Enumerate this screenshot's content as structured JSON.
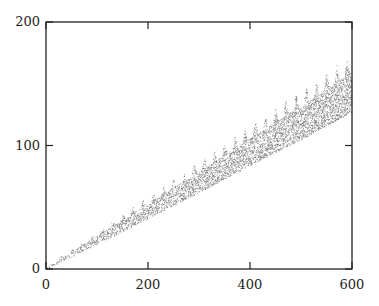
{
  "chart_data": {
    "type": "scatter",
    "title": "",
    "xlabel": "",
    "ylabel": "",
    "xlim": [
      0,
      600
    ],
    "ylim": [
      0,
      200
    ],
    "grid": false,
    "legend": null,
    "x_ticks": [
      0,
      200,
      400,
      600
    ],
    "y_ticks": [
      0,
      100,
      200
    ],
    "x_tick_labels": [
      "0",
      "200",
      "400",
      "600"
    ],
    "y_tick_labels": [
      "0",
      "100",
      "200"
    ],
    "marker": "small dots",
    "marker_color": "#555555",
    "series": [
      {
        "name": "points",
        "band": {
          "x": [
            0,
            100,
            200,
            300,
            400,
            500,
            600
          ],
          "y_low": [
            0,
            20,
            41,
            62,
            84,
            105,
            127
          ],
          "y_high": [
            1,
            27,
            53,
            79,
            106,
            132,
            160
          ],
          "y_spike_top": [
            2,
            31,
            59,
            88,
            117,
            146,
            175
          ]
        },
        "spike_period_x": 20
      }
    ]
  },
  "frame": {
    "left": 46,
    "right": 352,
    "top": 22,
    "bottom": 269
  }
}
